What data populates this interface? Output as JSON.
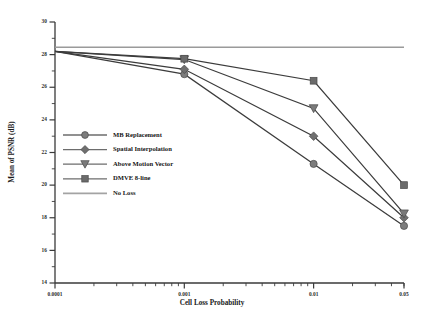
{
  "chart_data": {
    "type": "line",
    "title": "",
    "xlabel": "Cell Loss Probability",
    "ylabel": "Mean of PSNR (dB)",
    "xscale": "log",
    "xlim": [
      0.0001,
      0.05
    ],
    "ylim": [
      14,
      30
    ],
    "yticks": [
      14,
      16,
      18,
      20,
      22,
      24,
      26,
      28,
      30
    ],
    "xticks": [
      0.0001,
      0.001,
      0.01,
      0.05
    ],
    "xticklabels": [
      "0.0001",
      "0.001",
      "0.01",
      "0.05"
    ],
    "grid": false,
    "legend_position": "middle-left",
    "x": [
      0.0001,
      0.001,
      0.01,
      0.05
    ],
    "series": [
      {
        "name": "MB  Replacement",
        "marker": "circle",
        "color": "#7d7d7d",
        "values": [
          28.2,
          26.8,
          21.3,
          17.5
        ]
      },
      {
        "name": "Spatial Interpolation",
        "marker": "diamond",
        "color": "#6f6f6f",
        "values": [
          28.2,
          27.1,
          23.0,
          18.0
        ]
      },
      {
        "name": "Above Motion Vector",
        "marker": "triangle-down",
        "color": "#7a7a7a",
        "values": [
          28.2,
          27.7,
          24.7,
          18.25
        ]
      },
      {
        "name": "DMVE  8-line",
        "marker": "square",
        "color": "#6b6b6b",
        "values": [
          28.2,
          27.75,
          26.4,
          20.0
        ]
      },
      {
        "name": "No Loss",
        "marker": "none",
        "color": "#9a9a9a",
        "values": [
          28.45,
          28.45,
          28.45,
          28.45
        ]
      }
    ],
    "legend_entries": [
      {
        "label": "MB  Replacement",
        "marker": "circle",
        "color": "#7d7d7d"
      },
      {
        "label": "Spatial Interpolation",
        "marker": "diamond",
        "color": "#6f6f6f"
      },
      {
        "label": "Above Motion Vector",
        "marker": "triangle-down",
        "color": "#7a7a7a"
      },
      {
        "label": "DMVE  8-line",
        "marker": "square",
        "color": "#6b6b6b"
      },
      {
        "label": "No Loss",
        "marker": "none",
        "color": "#9a9a9a"
      }
    ]
  }
}
